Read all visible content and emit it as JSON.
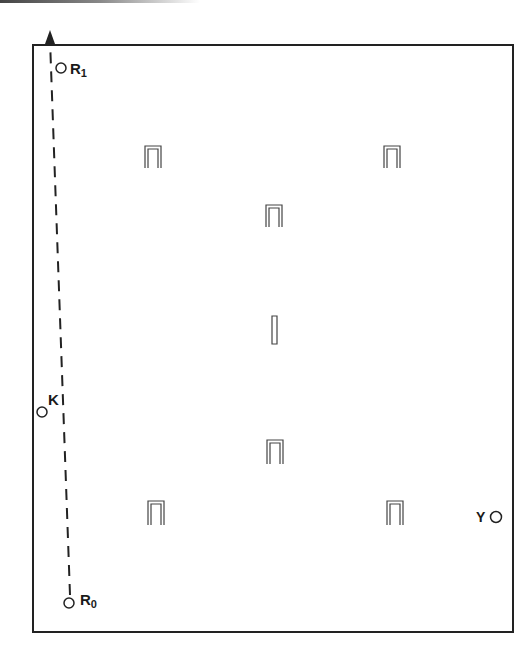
{
  "diagram": {
    "points": [
      {
        "id": "R1",
        "label": "R",
        "sub": "1",
        "x": 61,
        "y": 68
      },
      {
        "id": "K",
        "label": "K",
        "x": 42,
        "y": 412
      },
      {
        "id": "R0",
        "label": "R",
        "sub": "0",
        "x": 69,
        "y": 603
      },
      {
        "id": "Y",
        "label": "Y",
        "x": 496,
        "y": 517
      }
    ],
    "markers": [
      {
        "type": "arch",
        "x": 153,
        "y": 157
      },
      {
        "type": "arch",
        "x": 392,
        "y": 157
      },
      {
        "type": "arch",
        "x": 274,
        "y": 217
      },
      {
        "type": "bar",
        "x": 274,
        "y": 330
      },
      {
        "type": "arch",
        "x": 275,
        "y": 452
      },
      {
        "type": "arch",
        "x": 156,
        "y": 514
      },
      {
        "type": "arch",
        "x": 395,
        "y": 514
      }
    ],
    "path": {
      "style": "dashed",
      "from": [
        70,
        595
      ],
      "to": [
        50,
        32
      ],
      "arrow": "up"
    },
    "frame": {
      "left": 33,
      "top": 45,
      "right": 513,
      "bottom": 632
    }
  }
}
